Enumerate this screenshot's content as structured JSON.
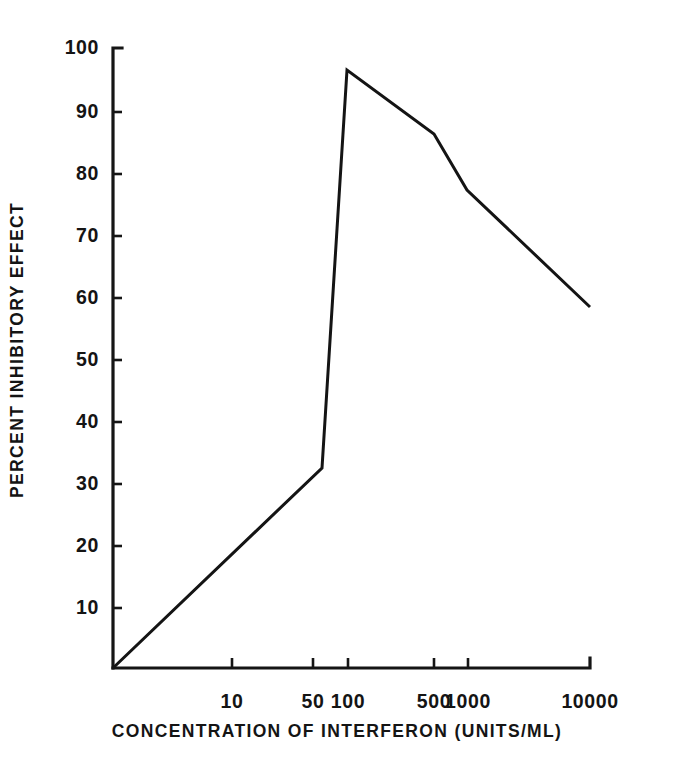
{
  "figure": {
    "background_color": "#ffffff",
    "ink_color": "#141414"
  },
  "chart_data": {
    "type": "line",
    "title": "",
    "subtitle": "",
    "xlabel": "CONCENTRATION OF INTERFERON (UNITS/ML)",
    "ylabel": "PERCENT INHIBITORY EFFECT",
    "x_scale": "log-like (hand drawn, non-uniform)",
    "x_tick_labels": [
      "10",
      "50",
      "100",
      "500",
      "1000",
      "10000"
    ],
    "x_tick_values": [
      10,
      50,
      100,
      500,
      1000,
      10000
    ],
    "y_tick_labels": [
      "10",
      "20",
      "30",
      "40",
      "50",
      "60",
      "70",
      "80",
      "90",
      "100"
    ],
    "y_tick_values": [
      10,
      20,
      30,
      40,
      50,
      60,
      70,
      80,
      90,
      100
    ],
    "ylim": [
      0,
      100
    ],
    "grid": false,
    "legend": false,
    "legend_position": "none",
    "series": [
      {
        "name": "Percent inhibitory effect",
        "x": [
          1,
          70,
          100,
          500,
          800,
          10000
        ],
        "values": [
          0,
          31,
          96,
          86,
          77,
          58
        ]
      }
    ],
    "annotations": []
  },
  "axes_geometry": {
    "origin_px": {
      "x": 113,
      "y": 668
    },
    "y_top_px": 48,
    "x_right_px": 590,
    "y_value_top": 100,
    "y_value_bottom": 0,
    "x_tick_positions_px": [
      232,
      313,
      348,
      434,
      468,
      590
    ],
    "y_tick_positions_px": [
      608,
      546,
      484,
      422,
      360,
      298,
      236,
      174,
      112,
      48
    ],
    "series_points_px": [
      {
        "x": 113,
        "y": 668
      },
      {
        "x": 322,
        "y": 468
      },
      {
        "x": 347,
        "y": 70
      },
      {
        "x": 434,
        "y": 134
      },
      {
        "x": 467,
        "y": 190
      },
      {
        "x": 590,
        "y": 307
      }
    ]
  }
}
